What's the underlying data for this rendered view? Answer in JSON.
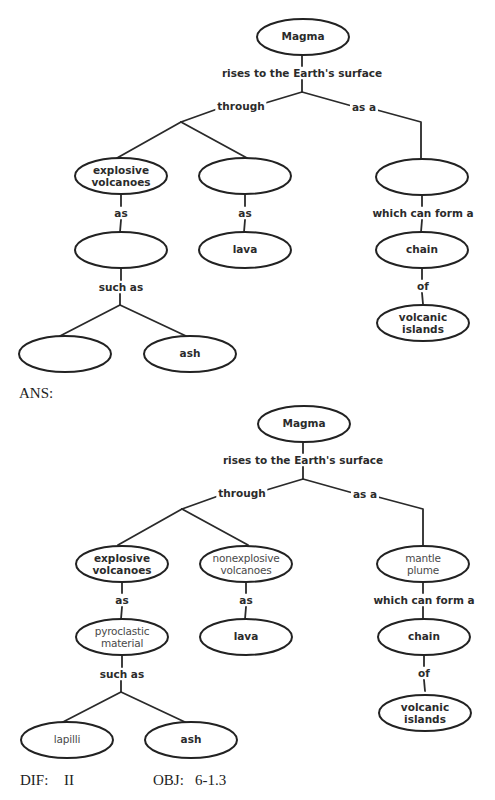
{
  "question_map": {
    "root": "Magma",
    "root_link": "rises to the Earth's surface",
    "left_link": "through",
    "right_link": "as a",
    "nodes": {
      "explosive": "explosive volcanoes",
      "nonexplosive": "",
      "mantle": "",
      "pyroclastic": "",
      "lava": "lava",
      "chain": "chain",
      "islands": "volcanic islands",
      "lapilli": "",
      "ash": "ash"
    },
    "links": {
      "explosive_as": "as",
      "nonexplosive_as": "as",
      "mantle_form": "which can form a",
      "pyro_such": "such as",
      "chain_of": "of"
    }
  },
  "answer_label": "ANS:",
  "answer_map": {
    "root": "Magma",
    "root_link": "rises to the Earth's surface",
    "left_link": "through",
    "right_link": "as a",
    "nodes": {
      "explosive": "explosive volcanoes",
      "nonexplosive": "nonexplosive volcanoes",
      "mantle": "mantle plume",
      "pyroclastic": "pyroclastic material",
      "lava": "lava",
      "chain": "chain",
      "islands": "volcanic islands",
      "lapilli": "lapilli",
      "ash": "ash"
    },
    "links": {
      "explosive_as": "as",
      "nonexplosive_as": "as",
      "mantle_form": "which can form a",
      "pyro_such": "such as",
      "chain_of": "of"
    }
  },
  "footer": {
    "dif_label": "DIF:",
    "dif_value": "II",
    "obj_label": "OBJ:",
    "obj_value": "6-1.3"
  }
}
